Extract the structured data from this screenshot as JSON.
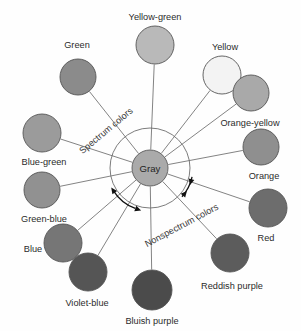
{
  "figure": {
    "background_color": "#fefefe",
    "line_color": "#6d6d6d",
    "label_color": "#2b2b2b"
  },
  "center": {
    "label": "Gray",
    "x": 150,
    "y": 168,
    "r": 18,
    "fill": "#aaaaaa"
  },
  "ring": {
    "cx": 150,
    "cy": 168,
    "r": 40
  },
  "regions": [
    {
      "id": "spectrum",
      "label": "Spectrum colors",
      "x": 108,
      "y": 133,
      "rotation": -40
    },
    {
      "id": "nonspectrum",
      "label": "Nonspectrum colors",
      "x": 183,
      "y": 228,
      "rotation": -28
    }
  ],
  "arrows": [
    {
      "id": "boundary-arrow-lower-left",
      "x": 131,
      "y": 211
    },
    {
      "id": "boundary-arrow-upper-right",
      "x": 184,
      "y": 191
    }
  ],
  "chart_data": {
    "type": "scatter",
    "xlabel": "",
    "ylabel": "",
    "categories": [
      "Yellow-green",
      "Yellow",
      "Orange-yellow",
      "Orange",
      "Red",
      "Reddish purple",
      "Bluish purple",
      "Violet-blue",
      "Blue",
      "Green-blue",
      "Blue-green",
      "Green"
    ],
    "nodes": [
      {
        "label": "Yellow-green",
        "cx": 155,
        "cy": 45,
        "r": 19,
        "fill": "#b9b9b9",
        "label_x": 155,
        "label_y": 20,
        "anchor": "middle",
        "region": "spectrum",
        "angle_deg": 92
      },
      {
        "label": "Yellow",
        "cx": 222,
        "cy": 75,
        "r": 19,
        "fill": "#f3f3f3",
        "label_x": 225,
        "label_y": 50,
        "anchor": "middle",
        "region": "spectrum",
        "angle_deg": 54
      },
      {
        "label": "Orange-yellow",
        "cx": 251,
        "cy": 93,
        "r": 18,
        "fill": "#a9a9a9",
        "label_x": 250,
        "label_y": 126,
        "anchor": "middle",
        "region": "spectrum",
        "angle_deg": 39
      },
      {
        "label": "Orange",
        "cx": 261,
        "cy": 147,
        "r": 18,
        "fill": "#8f8f8f",
        "label_x": 264,
        "label_y": 179,
        "anchor": "middle",
        "region": "spectrum",
        "angle_deg": 12
      },
      {
        "label": "Red",
        "cx": 268,
        "cy": 208,
        "r": 19,
        "fill": "#6d6d6d",
        "label_x": 266,
        "label_y": 241,
        "anchor": "middle",
        "region": "spectrum",
        "angle_deg": -19
      },
      {
        "label": "Reddish purple",
        "cx": 230,
        "cy": 253,
        "r": 19,
        "fill": "#5c5c5c",
        "label_x": 232,
        "label_y": 289,
        "anchor": "middle",
        "region": "nonspectrum",
        "angle_deg": -47
      },
      {
        "label": "Bluish purple",
        "cx": 152,
        "cy": 290,
        "r": 20,
        "fill": "#4b4b4b",
        "label_x": 152,
        "label_y": 324,
        "anchor": "middle",
        "region": "nonspectrum",
        "angle_deg": -89
      },
      {
        "label": "Violet-blue",
        "cx": 88,
        "cy": 272,
        "r": 19,
        "fill": "#555555",
        "label_x": 87,
        "label_y": 306,
        "anchor": "middle",
        "region": "spectrum",
        "angle_deg": -120
      },
      {
        "label": "Blue",
        "cx": 63,
        "cy": 243,
        "r": 19,
        "fill": "#767676",
        "label_x": 33,
        "label_y": 252,
        "anchor": "middle",
        "region": "spectrum",
        "angle_deg": -137
      },
      {
        "label": "Green-blue",
        "cx": 42,
        "cy": 190,
        "r": 18,
        "fill": "#919191",
        "label_x": 44,
        "label_y": 222,
        "anchor": "middle",
        "region": "spectrum",
        "angle_deg": -169
      },
      {
        "label": "Blue-green",
        "cx": 42,
        "cy": 133,
        "r": 19,
        "fill": "#9b9b9b",
        "label_x": 44,
        "label_y": 165,
        "anchor": "middle",
        "region": "spectrum",
        "angle_deg": 163
      },
      {
        "label": "Green",
        "cx": 78,
        "cy": 77,
        "r": 18,
        "fill": "#8b8b8b",
        "label_x": 77,
        "label_y": 48,
        "anchor": "middle",
        "region": "spectrum",
        "angle_deg": 129
      }
    ]
  }
}
